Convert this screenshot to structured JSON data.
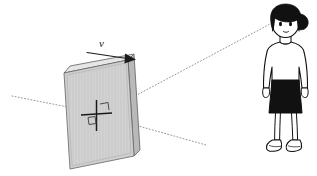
{
  "figure": {
    "type": "physics-diagram",
    "background_color": "#ffffff",
    "width": 317,
    "height": 176
  },
  "labels": {
    "velocity": "v",
    "velocity_x": 100,
    "velocity_y": 39
  },
  "mirror": {
    "name": "mirror-panel",
    "face_color": "#cfcfcf",
    "edge_color": "#5a5a5a",
    "side_color": "#b4b4b4",
    "top_color": "#e2e2e2",
    "front_face": "64,73 128,60 134,156 70,169",
    "top_face": "64,73 70,66 134,54 128,60",
    "side_face": "128,60 134,54 140,150 134,156"
  },
  "velocity_arrow": {
    "name": "velocity-arrow",
    "color": "#1a1a1a",
    "x1": 87,
    "y1": 53,
    "x2": 126,
    "y2": 58,
    "head": "126,54 136,59.5 126,63"
  },
  "cross_marker": {
    "name": "center-cross-marker",
    "color": "#1a1a1a",
    "v_x": 96,
    "v_y1": 101,
    "v_y2": 130,
    "h_x1": 82,
    "h_x2": 111,
    "h_y": 115,
    "right_angle": "101,104 108,103 108,110",
    "small_square": "88,117 95,116 95,123 88,124"
  },
  "sight_lines": [
    {
      "name": "eye-to-mirror-ray",
      "x1": 272,
      "y1": 23,
      "x2": 103,
      "y2": 113,
      "color": "#8a8a8a",
      "dash": "1,2.2"
    },
    {
      "name": "incoming-ray-left",
      "x1": 12,
      "y1": 96,
      "x2": 103,
      "y2": 114,
      "color": "#8a8a8a",
      "dash": "1,2.2"
    },
    {
      "name": "outgoing-ray-right",
      "x1": 103,
      "y1": 116,
      "x2": 206,
      "y2": 145,
      "color": "#8a8a8a",
      "dash": "1,2.2"
    }
  ],
  "observer": {
    "name": "observer-girl",
    "hair_color": "#111111",
    "skirt_color": "#111111",
    "skin_color": "#ffffff",
    "shirt_color": "#ffffff",
    "outline_color": "#111111",
    "shoe_color": "#ffffff"
  }
}
